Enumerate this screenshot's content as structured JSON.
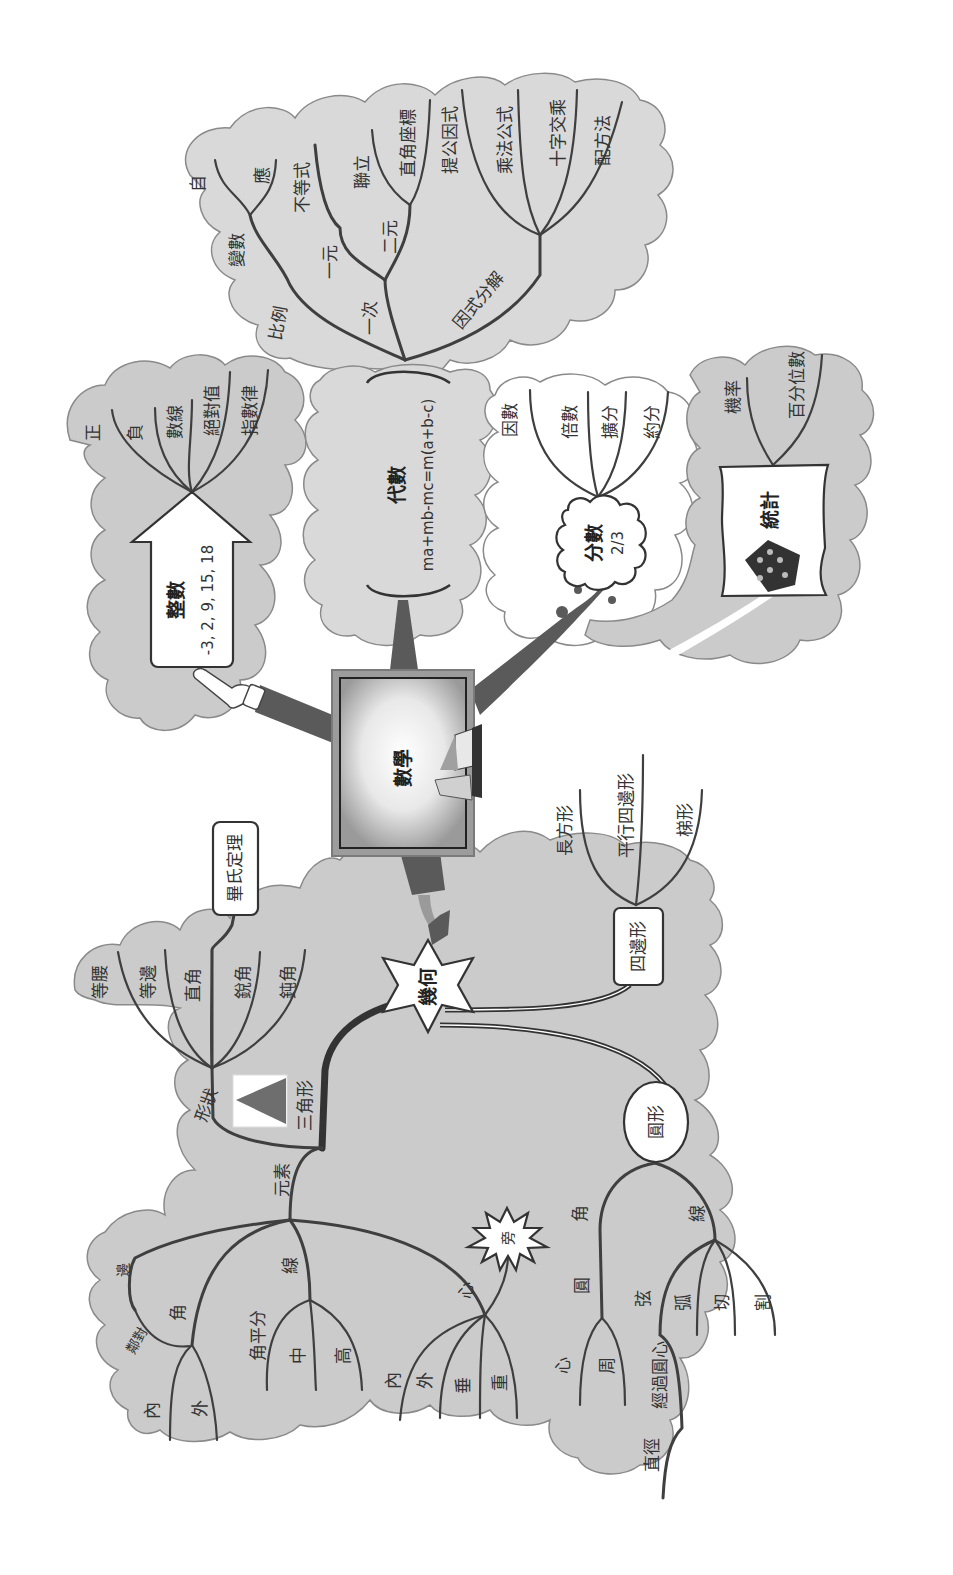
{
  "title": "數學",
  "branches": {
    "algebra": {
      "label": "代數",
      "formula": "ma+mb-mc=m(a+b-c)",
      "children": {
        "ratio": "比例",
        "variable": "變數",
        "independent": "自",
        "dependent": "應",
        "linear": "一次",
        "one_var": "一元",
        "inequality": "不等式",
        "two_var": "二元",
        "simultaneous": "聯立",
        "coordinates": "直角座標",
        "factorization": "因式分解",
        "common_factor": "提公因式",
        "multiplication_formula": "乘法公式",
        "cross_multiplication": "十字交乘",
        "completing_square": "配方法"
      }
    },
    "integers": {
      "label": "整數",
      "example": "-3, 2, 9, 15, 18",
      "children": [
        "正",
        "負",
        "數線",
        "絕對值",
        "指數律"
      ]
    },
    "fractions": {
      "label": "分數",
      "example": "2/3",
      "children": [
        "因數",
        "倍數",
        "擴分",
        "約分"
      ]
    },
    "statistics": {
      "label": "統計",
      "children": [
        "機率",
        "百分位數"
      ]
    },
    "geometry": {
      "label": "幾何",
      "triangle": {
        "label": "三角形",
        "shape": "形狀",
        "shape_children": [
          "等腰",
          "等邊",
          "直角",
          "銳角",
          "鈍角"
        ],
        "pythagoras": "畢氏定理",
        "elements": "元素",
        "side": "邊",
        "adjacent_opposite": "鄰對",
        "angle": "角",
        "angle_children": [
          "內",
          "外"
        ],
        "line": "線",
        "line_children": [
          "角平分",
          "中",
          "高"
        ],
        "center": "心",
        "center_children": [
          "內",
          "外",
          "垂",
          "重"
        ],
        "excenter": "旁"
      },
      "quadrilateral": {
        "label": "四邊形",
        "children": [
          "長方形",
          "平行四邊形",
          "梯形"
        ]
      },
      "circle": {
        "label": "圓形",
        "angle": "角",
        "angle_circle": "圓",
        "angle_children": [
          "心",
          "周"
        ],
        "line": "線",
        "line_children": [
          "弦",
          "弧",
          "切",
          "割"
        ],
        "through_center": "經過圓心",
        "diameter": "直徑"
      }
    }
  },
  "colors": {
    "cloud": "#cbcbcb",
    "branch": "#3f3f3f",
    "background": "#ffffff"
  }
}
